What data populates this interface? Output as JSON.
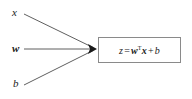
{
  "diagram": {
    "background_color": "#ffffff",
    "stroke_color": "#4d4d4d",
    "box_border_color": "#8a8a8a",
    "text_color": "#1a1a1a",
    "inputs": [
      {
        "id": "x",
        "label": "x",
        "style": "italic",
        "x": 13,
        "y": 13
      },
      {
        "id": "w",
        "label": "w",
        "style": "bold-italic",
        "x": 13,
        "y": 49
      },
      {
        "id": "b",
        "label": "b",
        "style": "italic",
        "x": 14,
        "y": 84
      }
    ],
    "edges": [
      {
        "from": "x",
        "to": "node",
        "x1": 24,
        "y1": 14,
        "x2": 95,
        "y2": 48
      },
      {
        "from": "w",
        "to": "node",
        "x1": 24,
        "y1": 49,
        "x2": 95,
        "y2": 49
      },
      {
        "from": "b",
        "to": "node",
        "x1": 24,
        "y1": 85,
        "x2": 95,
        "y2": 51
      }
    ],
    "arrowhead": {
      "x": 96,
      "y": 49
    },
    "formula": {
      "full_text": "z = wTx + b",
      "lhs": "z",
      "equals": "=",
      "weight_vector": "w",
      "transpose": "T",
      "input_vector": "x",
      "plus": "+",
      "bias": "b"
    }
  }
}
